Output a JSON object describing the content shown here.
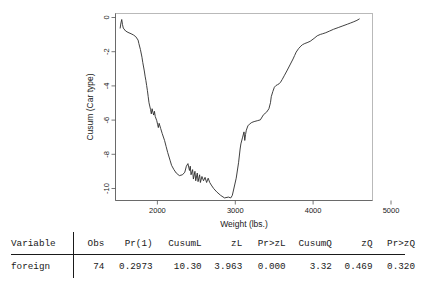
{
  "chart_data": {
    "type": "line",
    "title": "",
    "xlabel": "Weight (lbs.)",
    "ylabel": "Cusum (Car type)",
    "xlim": [
      1700,
      5000
    ],
    "ylim": [
      -10.6,
      0.3
    ],
    "xticks": [
      2000,
      3000,
      4000,
      5000
    ],
    "xtick_labels": [
      "2000",
      "3000",
      "4000",
      "5000"
    ],
    "yticks": [
      0,
      -2,
      -4,
      -6,
      -8,
      -10
    ],
    "ytick_labels": [
      "0",
      "-2",
      "-4",
      "-6",
      "-8",
      "-10"
    ],
    "grid": false,
    "legend": null,
    "series": [
      {
        "name": "Cusum (Car type)",
        "x": [
          1760,
          1770,
          1780,
          1790,
          1800,
          1830,
          1860,
          1900,
          1930,
          1960,
          1990,
          2000,
          2020,
          2040,
          2050,
          2070,
          2080,
          2090,
          2100,
          2110,
          2120,
          2130,
          2150,
          2160,
          2170,
          2180,
          2190,
          2200,
          2210,
          2230,
          2240,
          2250,
          2260,
          2280,
          2300,
          2330,
          2350,
          2370,
          2400,
          2420,
          2450,
          2480,
          2520,
          2560,
          2590,
          2610,
          2630,
          2650,
          2660,
          2670,
          2690,
          2700,
          2720,
          2730,
          2750,
          2760,
          2780,
          2790,
          2810,
          2830,
          2850,
          2870,
          2890,
          2910,
          2930,
          2960,
          3000,
          3050,
          3100,
          3150,
          3180,
          3200,
          3250,
          3280,
          3300,
          3310,
          3330,
          3350,
          3360,
          3370,
          3380,
          3400,
          3420,
          3450,
          3480,
          3520,
          3560,
          3600,
          3640,
          3670,
          3690,
          3700,
          3720,
          3740,
          3760,
          3780,
          3800,
          3820,
          3840,
          3870,
          3900,
          3940,
          3980,
          4000,
          4020,
          4050,
          4080,
          4100,
          4130,
          4160,
          4200,
          4250,
          4290,
          4330,
          4360,
          4400,
          4450,
          4500,
          4560,
          4620,
          4680,
          4720,
          4760,
          4800,
          4830
        ],
        "y": [
          -0.55,
          -0.25,
          -0.05,
          -0.35,
          -0.55,
          -0.72,
          -0.8,
          -0.88,
          -0.95,
          -1.05,
          -1.25,
          -1.45,
          -1.8,
          -2.25,
          -2.55,
          -3.05,
          -3.35,
          -3.6,
          -3.9,
          -4.2,
          -4.55,
          -4.9,
          -5.3,
          -5.55,
          -5.25,
          -5.45,
          -5.62,
          -5.4,
          -5.7,
          -5.95,
          -6.15,
          -6.35,
          -6.1,
          -6.4,
          -6.7,
          -7.1,
          -7.45,
          -7.8,
          -8.25,
          -8.55,
          -8.8,
          -9.0,
          -9.15,
          -9.1,
          -8.95,
          -8.6,
          -8.45,
          -8.85,
          -8.6,
          -9.1,
          -8.8,
          -9.35,
          -8.9,
          -9.45,
          -9.0,
          -9.5,
          -9.1,
          -9.55,
          -9.2,
          -9.45,
          -9.25,
          -9.55,
          -9.3,
          -9.55,
          -9.7,
          -9.9,
          -10.1,
          -10.3,
          -10.45,
          -10.4,
          -10.45,
          -10.3,
          -9.3,
          -8.4,
          -7.6,
          -7.3,
          -6.95,
          -6.6,
          -7.1,
          -6.75,
          -6.5,
          -6.25,
          -6.15,
          -6.05,
          -6.0,
          -5.95,
          -5.9,
          -5.6,
          -5.45,
          -5.25,
          -4.9,
          -4.55,
          -4.25,
          -4.0,
          -3.9,
          -3.85,
          -3.8,
          -3.7,
          -3.55,
          -3.3,
          -3.05,
          -2.7,
          -2.35,
          -2.15,
          -1.95,
          -1.75,
          -1.6,
          -1.52,
          -1.45,
          -1.4,
          -1.32,
          -1.15,
          -1.0,
          -0.92,
          -0.88,
          -0.82,
          -0.72,
          -0.62,
          -0.52,
          -0.42,
          -0.32,
          -0.25,
          -0.18,
          -0.1,
          -0.02
        ]
      }
    ]
  },
  "table": {
    "headers": [
      "Variable",
      "Obs",
      "Pr(1)",
      "CusumL",
      "zL",
      "Pr>zL",
      "CusumQ",
      "zQ",
      "Pr>zQ"
    ],
    "rows": [
      {
        "variable": "foreign",
        "obs": "74",
        "pr1": "0.2973",
        "cusuml": "10.30",
        "zl": "3.963",
        "pr_zl": "0.000",
        "cusumq": "3.32",
        "zq": "0.469",
        "pr_zq": "0.320"
      }
    ]
  },
  "colors": {
    "line": "#2b2b2b",
    "frame": "#a9a9a9",
    "axis": "#555555",
    "text": "#1a1a1a",
    "background": "#ffffff"
  }
}
